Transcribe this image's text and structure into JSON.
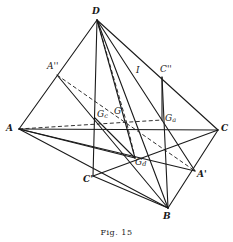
{
  "figure": {
    "caption": "Fig. 15",
    "points": {
      "D": {
        "label": "D",
        "x": 97,
        "y": 20
      },
      "A": {
        "label": "A",
        "x": 19,
        "y": 129
      },
      "C": {
        "label": "C",
        "x": 218,
        "y": 130
      },
      "B": {
        "label": "B",
        "x": 168,
        "y": 208
      },
      "A2": {
        "label": "A''",
        "x": 57,
        "y": 75
      },
      "C2": {
        "label": "C''",
        "x": 162,
        "y": 77
      },
      "Ga": {
        "label": "G",
        "sub": "a",
        "x": 162,
        "y": 120
      },
      "Gc": {
        "label": "G",
        "sub": "c",
        "x": 95,
        "y": 118
      },
      "G": {
        "label": "G",
        "x": 127,
        "y": 124
      },
      "Gd": {
        "label": "G",
        "sub": "d",
        "x": 135,
        "y": 158
      },
      "C1": {
        "label": "C'",
        "x": 93,
        "y": 176
      },
      "A1": {
        "label": "A'",
        "x": 195,
        "y": 171
      },
      "I": {
        "label": "I",
        "x": 138,
        "y": 69
      }
    },
    "solid_edges": [
      [
        "D",
        "A"
      ],
      [
        "D",
        "C"
      ],
      [
        "D",
        "B"
      ],
      [
        "A",
        "C"
      ],
      [
        "A",
        "B"
      ],
      [
        "C",
        "B"
      ],
      [
        "D",
        "C1"
      ],
      [
        "D",
        "Gd"
      ],
      [
        "A",
        "A1"
      ],
      [
        "A",
        "Gd"
      ],
      [
        "C",
        "C1"
      ],
      [
        "C1",
        "B"
      ],
      [
        "A2",
        "B"
      ],
      [
        "C2",
        "B"
      ],
      [
        "D",
        "A1"
      ],
      [
        "C2",
        "Ga"
      ],
      [
        "Gc",
        "Gd"
      ]
    ],
    "dashed_edges": [
      [
        "A",
        "Ga"
      ],
      [
        "A2",
        "A1"
      ],
      [
        "D",
        "G"
      ],
      [
        "G",
        "Gd"
      ]
    ],
    "colors": {
      "stroke": "#1a1a1a",
      "background": "#ffffff"
    }
  }
}
